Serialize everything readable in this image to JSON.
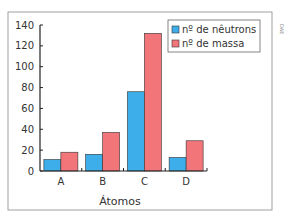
{
  "chart_data": {
    "type": "bar",
    "title": "",
    "xlabel": "Átomos",
    "ylabel": "",
    "categories": [
      "A",
      "B",
      "C",
      "D"
    ],
    "ylim": [
      0,
      140
    ],
    "yticks": [
      0,
      20,
      40,
      60,
      80,
      100,
      120,
      140
    ],
    "grid": false,
    "legend_position": "top-right",
    "series": [
      {
        "name": "nº de nêutrons",
        "color": "#3daee9",
        "values": [
          11,
          16,
          76,
          13
        ]
      },
      {
        "name": "nº de massa",
        "color": "#f2757a",
        "values": [
          18,
          37,
          132,
          29
        ]
      }
    ]
  },
  "credit": "DAE"
}
